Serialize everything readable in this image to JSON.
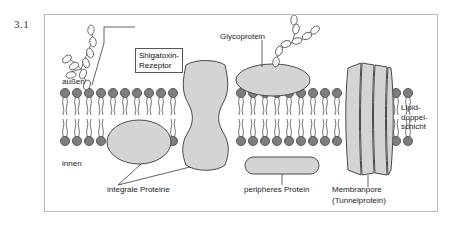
{
  "figure": {
    "number": "3.1"
  },
  "diagram": {
    "title_internal": "fluid-mosaic-membrane",
    "colors": {
      "lipid_head": "#7d7d7d",
      "lipid_head_stroke": "#4a4a4a",
      "protein_fill": "#d4d4d4",
      "protein_stroke": "#4a4a4a",
      "sugar_fill": "#ffffff",
      "sugar_stroke": "#4a4a4a",
      "frame_border": "#b9b9b9",
      "text": "#1a1a1a",
      "leader_line": "#3a3a3a",
      "background": "#ffffff"
    },
    "labels": {
      "receptor": "Shigatoxin-\nRezeptor",
      "outside": "außen",
      "inside": "innen",
      "glycoprotein": "Glycoprotein",
      "bilayer": "Lipid-\ndoppel-\nschicht",
      "integral_proteins": "integrale Proteine",
      "peripheral_protein": "peripheres Protein",
      "membrane_pore": "Membranpore",
      "membrane_pore_sub": "(Tunnelprotein)"
    },
    "structures": [
      {
        "name": "shigatoxin-receptor-glycolipid",
        "type": "branched-sugar-chain",
        "units": 9
      },
      {
        "name": "integral-protein-hourglass",
        "type": "transmembrane-protein"
      },
      {
        "name": "integral-protein-ellipse",
        "type": "inner-leaflet-protein"
      },
      {
        "name": "glycoprotein-ellipse",
        "type": "outer-surface-glycoprotein",
        "sugar_units": 8
      },
      {
        "name": "peripheral-protein-pill",
        "type": "peripheral-protein"
      },
      {
        "name": "membrane-pore",
        "type": "tunnel-protein",
        "segments": 4
      }
    ],
    "lipid_bilayer": {
      "outer_leaflet_y": 92,
      "inner_leaflet_y": 138,
      "head_radius": 5,
      "tail_length": 26
    }
  }
}
